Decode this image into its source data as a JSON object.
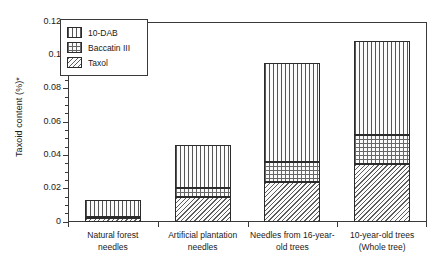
{
  "chart_data": {
    "type": "bar",
    "subtype": "stacked-bar",
    "title": "",
    "xlabel": "",
    "ylabel": "Taxoid content (%)*",
    "ylim": [
      0,
      0.12
    ],
    "ytick_labels": [
      "0",
      "0.02",
      "0.04",
      "0.06",
      "0.08",
      "0.1",
      "0.12"
    ],
    "ytick_values": [
      0,
      0.02,
      0.04,
      0.06,
      0.08,
      0.1,
      0.12
    ],
    "minor_tick_step": 0.005,
    "grid": false,
    "legend_position": "top-left",
    "categories": [
      "Natural forest needles",
      "Artificial plantation needles",
      "Needles from 16-year-old trees",
      "10-year-old trees (Whole tree)"
    ],
    "category_label_lines": [
      [
        "Natural forest",
        "needles"
      ],
      [
        "Artificial plantation",
        "needles"
      ],
      [
        "Needles from 16-year-",
        "old trees"
      ],
      [
        "10-year-old trees",
        "(Whole tree)"
      ]
    ],
    "series": [
      {
        "name": "Taxol",
        "pattern": "diagonal-hatch",
        "values": [
          0.0024,
          0.015,
          0.024,
          0.0348
        ]
      },
      {
        "name": "Baccatin III",
        "pattern": "cross-hatch",
        "values": [
          0.0008,
          0.0055,
          0.012,
          0.0177
        ]
      },
      {
        "name": "10-DAB",
        "pattern": "vertical-lines",
        "values": [
          0.01,
          0.0255,
          0.0594,
          0.0561
        ]
      }
    ],
    "stack_totals": [
      0.0132,
      0.046,
      0.0954,
      0.1086
    ],
    "cumulative_boundaries": [
      [
        0.0024,
        0.0032,
        0.0132
      ],
      [
        0.015,
        0.0205,
        0.046
      ],
      [
        0.024,
        0.036,
        0.0954
      ],
      [
        0.0348,
        0.0525,
        0.1086
      ]
    ]
  },
  "legend": {
    "entries": [
      {
        "label": "10-DAB"
      },
      {
        "label": "Baccatin III"
      },
      {
        "label": "Taxol"
      }
    ]
  },
  "axis": {
    "y_title": "Taxoid content (%)*"
  },
  "colors": {
    "frame": "#3a3a3a",
    "hatch": "#555555",
    "background": "#ffffff",
    "text": "#1a1a1a"
  }
}
